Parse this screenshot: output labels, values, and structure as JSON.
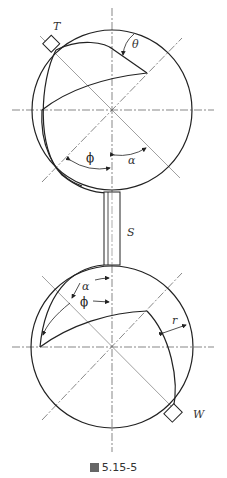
{
  "figure": {
    "caption": "圖 5.15-5",
    "caption_prefix": "圖",
    "caption_number": "5.15-5"
  },
  "top_view": {
    "labels": {
      "T": "T",
      "theta": "θ",
      "phi": "ϕ",
      "alpha": "α"
    }
  },
  "stem": {
    "label": "S"
  },
  "bottom_view": {
    "labels": {
      "alpha": "α",
      "phi": "ϕ",
      "r": "r",
      "W": "W"
    }
  }
}
